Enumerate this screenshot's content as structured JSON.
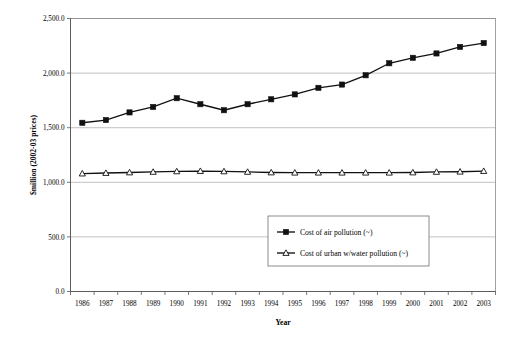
{
  "chart_data": {
    "type": "line",
    "title": "",
    "xlabel": "Year",
    "ylabel": "$million (2002-03 prices)",
    "categories": [
      "1986",
      "1987",
      "1988",
      "1989",
      "1990",
      "1991",
      "1992",
      "1993",
      "1994",
      "1995",
      "1996",
      "1997",
      "1998",
      "1999",
      "2000",
      "2001",
      "2002",
      "2003"
    ],
    "ylim": [
      0,
      2500
    ],
    "ytick_labels": [
      "0.0",
      "500.0",
      "1,000.0",
      "1,500.0",
      "2,000.0",
      "2,500.0"
    ],
    "ytick_values": [
      0,
      500,
      1000,
      1500,
      2000,
      2500
    ],
    "grid": true,
    "legend_position": "inside-center-lower",
    "series": [
      {
        "name": "Cost of air pollution (~)",
        "marker": "filled-square",
        "values": [
          1545,
          1570,
          1640,
          1690,
          1770,
          1715,
          1660,
          1715,
          1760,
          1805,
          1865,
          1895,
          1980,
          2090,
          2140,
          2180,
          2240,
          2275
        ]
      },
      {
        "name": "Cost of urban w/water pollution (~)",
        "marker": "open-triangle",
        "values": [
          1080,
          1085,
          1090,
          1095,
          1100,
          1103,
          1100,
          1095,
          1090,
          1088,
          1088,
          1088,
          1088,
          1088,
          1090,
          1095,
          1097,
          1103
        ]
      }
    ]
  },
  "axis": {
    "x_title": "Year",
    "y_title": "$million (2002-03 prices)"
  },
  "legend": {
    "entries": [
      {
        "label": "Cost of air pollution (~)"
      },
      {
        "label": "Cost of urban w/water pollution (~)"
      }
    ]
  }
}
